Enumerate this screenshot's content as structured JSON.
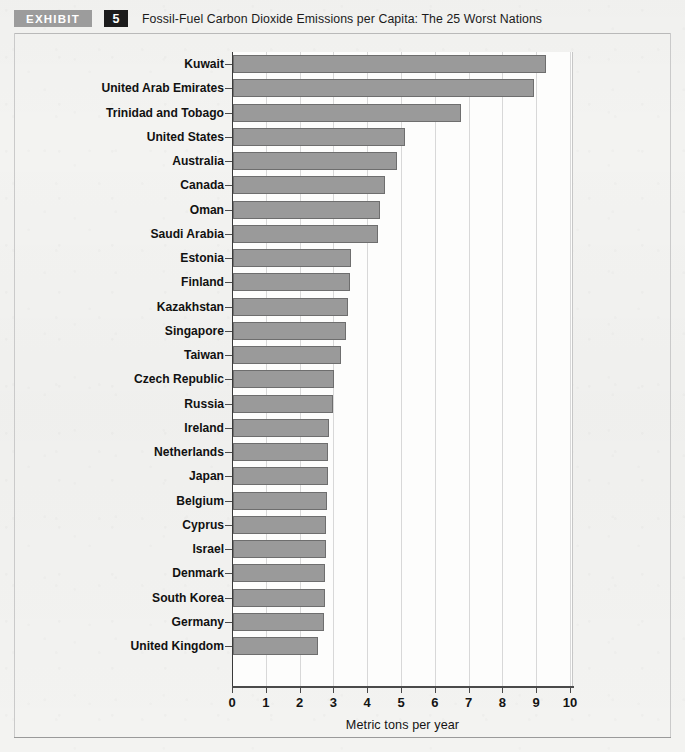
{
  "exhibit": {
    "tag": "EXHIBIT",
    "number": "5",
    "title": "Fossil-Fuel Carbon Dioxide Emissions per Capita: The 25 Worst Nations"
  },
  "chart_data": {
    "type": "bar",
    "orientation": "horizontal",
    "title": "Fossil-Fuel Carbon Dioxide Emissions per Capita: The 25 Worst Nations",
    "xlabel": "Metric tons per year",
    "ylabel": "",
    "xlim": [
      0,
      10.1
    ],
    "xticks": [
      0,
      1,
      2,
      3,
      4,
      5,
      6,
      7,
      8,
      9,
      10
    ],
    "xticklabels": [
      "0",
      "1",
      "2",
      "3",
      "4",
      "5",
      "6",
      "7",
      "8",
      "9",
      "10"
    ],
    "grid": "vertical",
    "legend": "none",
    "bar_color": "#9a9a9a",
    "bar_edge_color": "#6e6e6e",
    "categories": [
      "Kuwait",
      "United Arab Emirates",
      "Trinidad and Tobago",
      "United States",
      "Australia",
      "Canada",
      "Oman",
      "Saudi Arabia",
      "Estonia",
      "Finland",
      "Kazakhstan",
      "Singapore",
      "Taiwan",
      "Czech Republic",
      "Russia",
      "Ireland",
      "Netherlands",
      "Japan",
      "Belgium",
      "Cyprus",
      "Israel",
      "Denmark",
      "South Korea",
      "Germany",
      "United Kingdom"
    ],
    "values": [
      9.25,
      8.9,
      6.75,
      5.1,
      4.85,
      4.5,
      4.35,
      4.3,
      3.5,
      3.45,
      3.4,
      3.35,
      3.2,
      3.0,
      2.95,
      2.85,
      2.82,
      2.8,
      2.78,
      2.75,
      2.74,
      2.72,
      2.72,
      2.7,
      2.5
    ]
  }
}
